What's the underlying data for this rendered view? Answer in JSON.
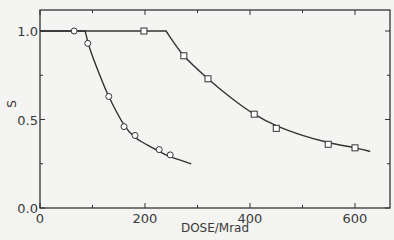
{
  "chart_data": {
    "type": "line",
    "title": "",
    "xlabel": "DOSE/Mrad",
    "ylabel": "S",
    "xlim": [
      0,
      665
    ],
    "ylim": [
      0,
      1.12
    ],
    "x_ticks": [
      0,
      100,
      200,
      300,
      400,
      500,
      600
    ],
    "x_tick_labels": [
      "0",
      "",
      "200",
      "",
      "400",
      "",
      "600"
    ],
    "y_ticks": [
      0.0,
      0.25,
      0.5,
      0.75,
      1.0
    ],
    "y_tick_labels": [
      "0.0",
      "",
      "0.5",
      "",
      "1.0"
    ],
    "grid": false,
    "legend": null,
    "series": [
      {
        "name": "circles",
        "marker": "circle",
        "points": [
          {
            "x": 65,
            "y": 1.0
          },
          {
            "x": 91,
            "y": 0.93
          },
          {
            "x": 131,
            "y": 0.63
          },
          {
            "x": 160,
            "y": 0.46
          },
          {
            "x": 181,
            "y": 0.41
          },
          {
            "x": 227,
            "y": 0.33
          },
          {
            "x": 248,
            "y": 0.3
          }
        ],
        "curve": [
          [
            0,
            1.0
          ],
          [
            86,
            1.0
          ],
          [
            95,
            0.9
          ],
          [
            110,
            0.78
          ],
          [
            131,
            0.63
          ],
          [
            160,
            0.47
          ],
          [
            181,
            0.4
          ],
          [
            205,
            0.355
          ],
          [
            227,
            0.32
          ],
          [
            248,
            0.29
          ],
          [
            288,
            0.25
          ]
        ]
      },
      {
        "name": "squares",
        "marker": "square",
        "points": [
          {
            "x": 198,
            "y": 1.0
          },
          {
            "x": 274,
            "y": 0.86
          },
          {
            "x": 320,
            "y": 0.73
          },
          {
            "x": 408,
            "y": 0.53
          },
          {
            "x": 450,
            "y": 0.45
          },
          {
            "x": 549,
            "y": 0.36
          },
          {
            "x": 600,
            "y": 0.34
          }
        ],
        "curve": [
          [
            0,
            1.0
          ],
          [
            240,
            1.0
          ],
          [
            274,
            0.86
          ],
          [
            320,
            0.73
          ],
          [
            365,
            0.62
          ],
          [
            408,
            0.53
          ],
          [
            450,
            0.465
          ],
          [
            500,
            0.41
          ],
          [
            549,
            0.37
          ],
          [
            600,
            0.34
          ],
          [
            629,
            0.32
          ]
        ]
      }
    ]
  },
  "colors": {
    "ink": "#333333",
    "background": "#f4f4f2",
    "marker_fill": "#ffffff"
  }
}
